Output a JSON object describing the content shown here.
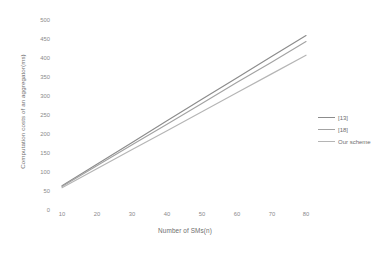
{
  "chart_data": {
    "type": "line",
    "title": "",
    "subtitle": "",
    "xlabel": "Number of SMs(n)",
    "ylabel": "Computation costs of  an aggregator(ms)",
    "xlim": [
      0,
      90
    ],
    "ylim": [
      0,
      500
    ],
    "grid": false,
    "legend_position": "right",
    "x": [
      10,
      20,
      30,
      40,
      50,
      60,
      70,
      80
    ],
    "xticks": [
      "10",
      "20",
      "30",
      "40",
      "50",
      "60",
      "70",
      "80"
    ],
    "yticks": [
      "0",
      "50",
      "100",
      "150",
      "200",
      "250",
      "300",
      "350",
      "400",
      "450",
      "500"
    ],
    "series": [
      {
        "name": "[13]",
        "color": "#8c8c8c",
        "values": [
          60,
          117,
          174,
          231,
          288,
          344,
          401,
          457
        ]
      },
      {
        "name": "[18]",
        "color": "#a3a3a3",
        "values": [
          58,
          113,
          168,
          222,
          277,
          332,
          386,
          441
        ]
      },
      {
        "name": "Our scheme",
        "color": "#b5b5b5",
        "values": [
          55,
          105,
          155,
          205,
          255,
          305,
          355,
          405
        ]
      }
    ]
  },
  "legend": {
    "items": [
      {
        "label": "[13]"
      },
      {
        "label": "[18]"
      },
      {
        "label": "Our scheme"
      }
    ]
  }
}
